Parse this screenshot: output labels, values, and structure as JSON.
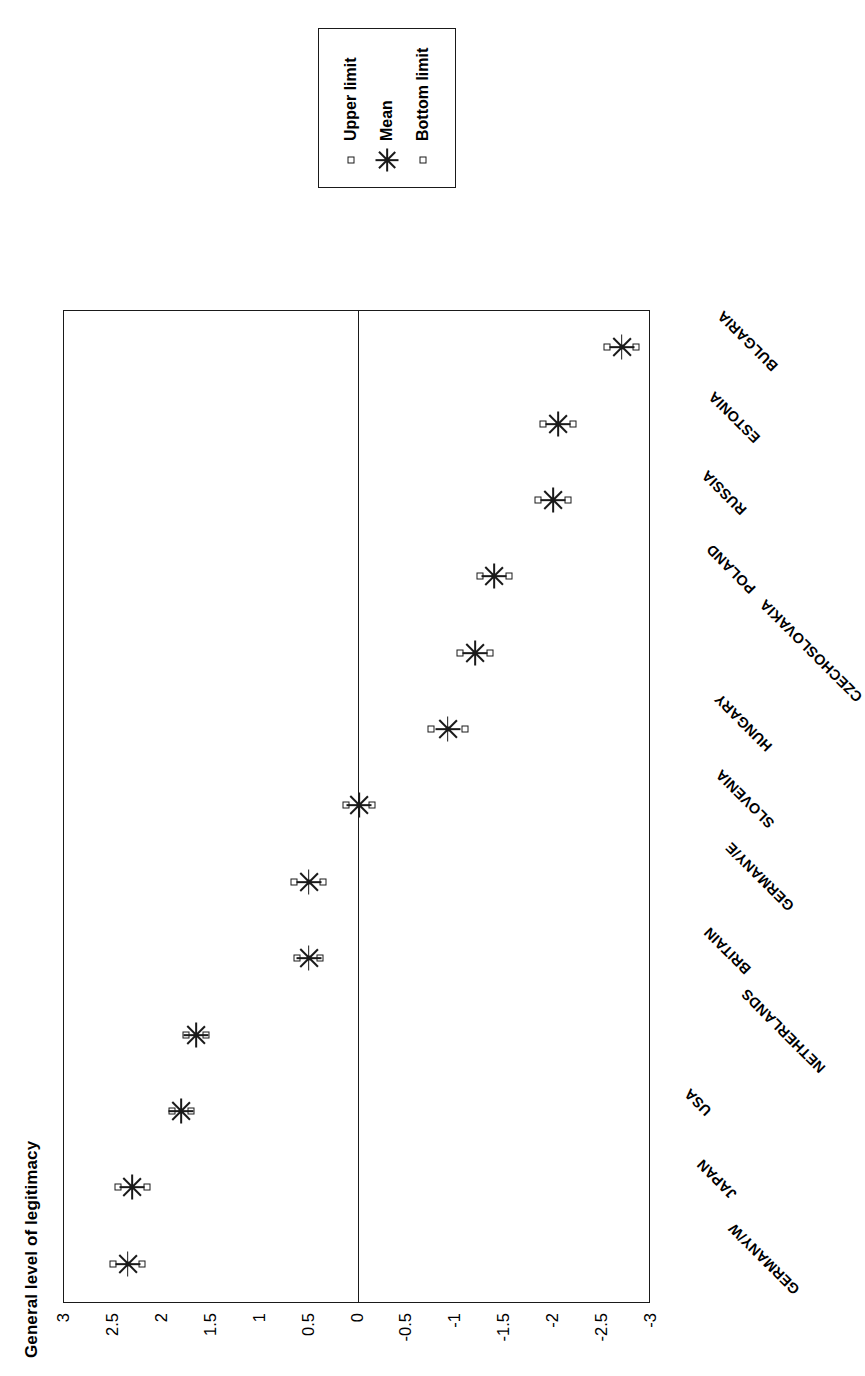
{
  "chart_data": {
    "type": "scatter",
    "title": "General level of legitimacy",
    "xlabel": "",
    "ylabel": "",
    "ylim": [
      -3,
      3
    ],
    "grid": false,
    "legend_position": "right",
    "yticks": [
      "3",
      "2.5",
      "2",
      "1.5",
      "1",
      "0.5",
      "0",
      "-0.5",
      "-1",
      "-1.5",
      "-2",
      "-2.5",
      "-3"
    ],
    "ytick_values": [
      3,
      2.5,
      2,
      1.5,
      1,
      0.5,
      0,
      -0.5,
      -1,
      -1.5,
      -2,
      -2.5,
      -3
    ],
    "categories": [
      "GERMANY/W",
      "JAPAN",
      "USA",
      "NETHERLANDS",
      "BRITAIN",
      "GERMANY/E",
      "SLOVENIA",
      "HUNGARY",
      "CZECHOSLOVAKIA",
      "POLAND",
      "RUSSIA",
      "ESTONIA",
      "BULGARIA"
    ],
    "series": [
      {
        "name": "Upper limit",
        "marker": "square",
        "values": [
          2.5,
          2.45,
          1.9,
          1.75,
          0.62,
          0.65,
          0.12,
          -0.75,
          -1.05,
          -1.25,
          -1.85,
          -1.9,
          -2.55
        ]
      },
      {
        "name": "Mean",
        "marker": "star",
        "values": [
          2.35,
          2.3,
          1.8,
          1.65,
          0.5,
          0.5,
          -0.02,
          -0.92,
          -1.2,
          -1.4,
          -2.0,
          -2.05,
          -2.7
        ]
      },
      {
        "name": "Bottom limit",
        "marker": "square",
        "values": [
          2.2,
          2.15,
          1.7,
          1.55,
          0.38,
          0.35,
          -0.15,
          -1.1,
          -1.35,
          -1.55,
          -2.15,
          -2.2,
          -2.85
        ]
      }
    ],
    "legend": [
      {
        "label": "Upper limit",
        "marker": "square"
      },
      {
        "label": "Mean",
        "marker": "star"
      },
      {
        "label": "Bottom limit",
        "marker": "square"
      }
    ],
    "zero_reference_line": 0
  }
}
